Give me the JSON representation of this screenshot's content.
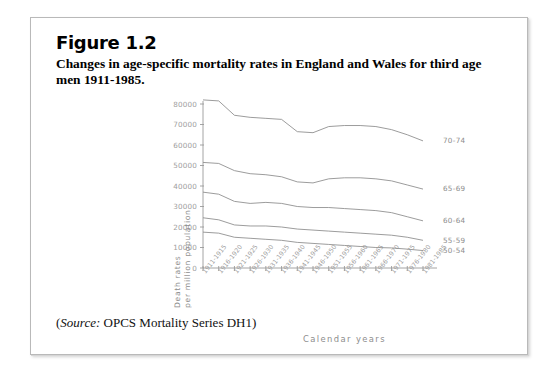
{
  "figure": {
    "number": "Figure 1.2",
    "title": "Changes in age-specific mortality rates in England and Wales for third age men 1911-1985.",
    "source_prefix": "(",
    "source_italic": "Source:",
    "source_text": " OPCS Mortality Series DH1)"
  },
  "chart_data": {
    "type": "line",
    "title": "Changes in age-specific mortality rates in England and Wales for third age men 1911-1985.",
    "xlabel": "Calendar years",
    "ylabel": "Death rates per million population",
    "ylabel_line1": "Death rates",
    "ylabel_line2": "per million population",
    "ylim": [
      0,
      80000
    ],
    "yticks": [
      0,
      10000,
      20000,
      30000,
      40000,
      50000,
      60000,
      70000,
      80000
    ],
    "ytick_labels": [
      "0",
      "10000",
      "20000",
      "30000",
      "40000",
      "50000",
      "60000",
      "70000",
      "80000"
    ],
    "grid": false,
    "legend_position": "right-inline",
    "categories": [
      "1911-1915",
      "1916-1920",
      "1921-1925",
      "1926-1930",
      "1931-1935",
      "1936-1940",
      "1941-1945",
      "1946-1950",
      "1951-1955",
      "1956-1960",
      "1961-1965",
      "1966-1970",
      "1971-1975",
      "1976-1980",
      "1981-1985"
    ],
    "series": [
      {
        "name": "70-74",
        "values": [
          82000,
          81500,
          74500,
          73500,
          73000,
          72500,
          66500,
          66000,
          69000,
          69500,
          69500,
          69000,
          67500,
          65000,
          62000
        ]
      },
      {
        "name": "65-69",
        "values": [
          51500,
          51000,
          47500,
          46000,
          45500,
          44500,
          42000,
          41500,
          43500,
          44000,
          44000,
          43500,
          42500,
          40500,
          38500
        ]
      },
      {
        "name": "60-64",
        "values": [
          37000,
          36000,
          32500,
          31500,
          32000,
          31500,
          30000,
          29500,
          29500,
          29000,
          28500,
          28000,
          27000,
          25000,
          23000
        ]
      },
      {
        "name": "55-59",
        "values": [
          24500,
          23500,
          21000,
          20500,
          20500,
          20000,
          19000,
          18500,
          18000,
          17500,
          17000,
          16500,
          16000,
          15000,
          13500
        ]
      },
      {
        "name": "50-54",
        "values": [
          17500,
          17000,
          15000,
          14500,
          14000,
          13500,
          12500,
          12000,
          11500,
          11000,
          10500,
          10000,
          9800,
          9200,
          8500
        ]
      }
    ],
    "colors": {
      "axis": "#9a9a9a",
      "line": "#8a8a8a",
      "tick_text": "#9e9e9e",
      "series_label": "#8d8d8d"
    }
  }
}
